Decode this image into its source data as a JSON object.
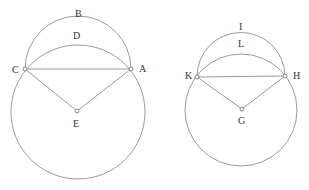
{
  "figures": [
    {
      "name": "left-figure",
      "big_circle": {
        "cx": 78,
        "cy": 112,
        "r": 67
      },
      "arc": {
        "cx": 78,
        "cy": 74,
        "r": 53
      },
      "points": {
        "C": {
          "x": 25,
          "y": 69
        },
        "A": {
          "x": 131,
          "y": 69
        },
        "E": {
          "x": 77,
          "y": 111
        }
      },
      "labels": [
        {
          "text": "B",
          "x": 75,
          "y": 17
        },
        {
          "text": "D",
          "x": 73,
          "y": 39
        },
        {
          "text": "C",
          "x": 12,
          "y": 73
        },
        {
          "text": "A",
          "x": 139,
          "y": 72
        },
        {
          "text": "E",
          "x": 73,
          "y": 127
        }
      ]
    },
    {
      "name": "right-figure",
      "big_circle": {
        "cx": 241,
        "cy": 110,
        "r": 56
      },
      "arc": {
        "cx": 241,
        "cy": 77,
        "r": 44
      },
      "points": {
        "K": {
          "x": 197,
          "y": 77
        },
        "H": {
          "x": 285,
          "y": 76
        },
        "G": {
          "x": 242,
          "y": 109
        }
      },
      "labels": [
        {
          "text": "I",
          "x": 239,
          "y": 30
        },
        {
          "text": "L",
          "x": 238,
          "y": 47
        },
        {
          "text": "K",
          "x": 185,
          "y": 79
        },
        {
          "text": "H",
          "x": 293,
          "y": 79
        },
        {
          "text": "G",
          "x": 238,
          "y": 124
        }
      ]
    }
  ],
  "colors": {
    "line": "#9a9a9a",
    "text": "#333333",
    "background": "#ffffff"
  }
}
